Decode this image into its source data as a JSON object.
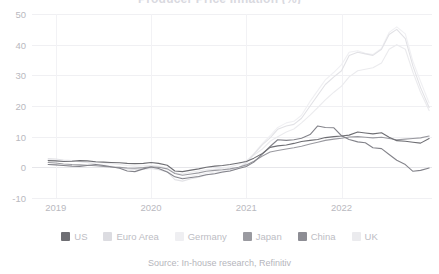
{
  "chart_data": {
    "type": "line",
    "title": "Producer Price Inflation (%)",
    "xlabel": "",
    "ylabel": "",
    "ylim": [
      -10,
      50
    ],
    "yticks": [
      50,
      40,
      30,
      20,
      10,
      0,
      -10
    ],
    "xticks": [
      "2019",
      "2020",
      "2021",
      "2022"
    ],
    "xtick_positions": [
      2019.0,
      2020.0,
      2021.0,
      2022.0
    ],
    "xlim": [
      2018.75,
      2022.95
    ],
    "grid": true,
    "legend_position": "bottom",
    "source": "Source: In-house research, Refinitiv",
    "x": [
      2018.92,
      2019.0,
      2019.08,
      2019.17,
      2019.25,
      2019.33,
      2019.42,
      2019.5,
      2019.58,
      2019.67,
      2019.75,
      2019.83,
      2019.92,
      2020.0,
      2020.08,
      2020.17,
      2020.25,
      2020.33,
      2020.42,
      2020.5,
      2020.58,
      2020.67,
      2020.75,
      2020.83,
      2020.92,
      2021.0,
      2021.08,
      2021.17,
      2021.25,
      2021.33,
      2021.42,
      2021.5,
      2021.58,
      2021.67,
      2021.75,
      2021.83,
      2021.92,
      2022.0,
      2022.08,
      2022.17,
      2022.25,
      2022.33,
      2022.42,
      2022.5,
      2022.58,
      2022.67,
      2022.75,
      2022.83,
      2022.92
    ],
    "series": [
      {
        "name": "US",
        "color": "#6e6e73",
        "values": [
          2.2,
          2.1,
          1.9,
          2.0,
          2.2,
          2.1,
          1.8,
          1.7,
          1.6,
          1.5,
          1.3,
          1.2,
          1.3,
          1.6,
          1.3,
          0.7,
          -1.2,
          -1.4,
          -0.9,
          -0.5,
          0.0,
          0.4,
          0.6,
          0.9,
          1.4,
          1.9,
          3.0,
          4.5,
          6.5,
          7.0,
          7.3,
          7.8,
          8.4,
          8.8,
          9.1,
          9.7,
          10.0,
          10.2,
          10.5,
          11.5,
          11.2,
          10.9,
          11.3,
          9.8,
          8.7,
          8.5,
          8.2,
          7.9,
          9.4
        ]
      },
      {
        "name": "Euro Area",
        "color": "#e2e2e6",
        "values": [
          2.9,
          2.7,
          2.4,
          2.2,
          2.0,
          1.6,
          1.0,
          0.6,
          0.2,
          -0.2,
          -0.5,
          -0.7,
          -0.6,
          -0.4,
          -0.8,
          -1.5,
          -4.0,
          -4.5,
          -3.7,
          -3.2,
          -2.5,
          -2.0,
          -1.7,
          -1.1,
          -0.3,
          1.4,
          4.3,
          7.4,
          9.6,
          12.4,
          13.5,
          14.0,
          16.0,
          20.0,
          23.5,
          27.0,
          29.5,
          31.5,
          36.5,
          37.5,
          37.0,
          36.5,
          38.5,
          43.3,
          45.0,
          42.0,
          33.0,
          26.0,
          19.5
        ]
      },
      {
        "name": "Germany",
        "color": "#f0f0f3",
        "values": [
          2.6,
          2.4,
          2.2,
          2.0,
          1.8,
          1.5,
          1.1,
          0.8,
          0.4,
          0.0,
          -0.3,
          -0.6,
          -0.5,
          -0.3,
          -0.6,
          -1.2,
          -3.0,
          -3.4,
          -2.8,
          -2.4,
          -1.9,
          -1.5,
          -1.2,
          -0.8,
          -0.1,
          1.9,
          4.5,
          7.8,
          10.3,
          13.0,
          14.5,
          15.0,
          17.0,
          21.5,
          25.0,
          28.5,
          31.0,
          33.5,
          37.5,
          38.0,
          37.2,
          36.8,
          38.8,
          44.0,
          45.8,
          43.5,
          34.5,
          28.0,
          21.0
        ]
      },
      {
        "name": "Japan",
        "color": "#9a9aa0",
        "values": [
          1.6,
          1.4,
          1.1,
          0.9,
          0.8,
          0.7,
          0.5,
          0.3,
          0.1,
          0.0,
          -0.2,
          -0.3,
          -0.1,
          0.2,
          0.0,
          -0.5,
          -2.0,
          -2.6,
          -2.2,
          -1.8,
          -1.3,
          -1.0,
          -0.8,
          -0.5,
          0.0,
          0.8,
          2.0,
          3.7,
          5.0,
          5.5,
          6.0,
          6.4,
          6.9,
          7.6,
          8.2,
          8.8,
          9.2,
          9.5,
          9.9,
          10.0,
          9.8,
          9.6,
          9.8,
          9.4,
          9.0,
          9.2,
          9.4,
          9.6,
          10.2
        ]
      },
      {
        "name": "China",
        "color": "#83838a",
        "values": [
          0.9,
          0.8,
          0.6,
          0.4,
          0.3,
          0.6,
          0.9,
          0.6,
          0.2,
          -0.3,
          -1.2,
          -1.4,
          -0.5,
          0.1,
          -0.4,
          -1.5,
          -3.1,
          -3.7,
          -3.3,
          -3.0,
          -2.4,
          -2.1,
          -1.5,
          -1.2,
          -0.4,
          0.3,
          1.7,
          4.4,
          6.8,
          9.0,
          8.8,
          9.0,
          9.5,
          10.7,
          13.5,
          13.0,
          12.9,
          10.3,
          9.1,
          8.3,
          8.0,
          6.4,
          6.1,
          4.2,
          2.3,
          0.9,
          -1.3,
          -1.0,
          -0.2
        ]
      },
      {
        "name": "UK",
        "color": "#ebebee",
        "values": [
          2.4,
          2.2,
          2.1,
          2.0,
          1.8,
          1.7,
          1.6,
          1.5,
          1.2,
          0.9,
          0.6,
          0.4,
          0.5,
          0.7,
          0.4,
          -0.2,
          -1.8,
          -2.2,
          -1.6,
          -1.2,
          -0.8,
          -0.6,
          -0.3,
          0.2,
          0.9,
          2.2,
          4.0,
          6.0,
          8.5,
          10.0,
          11.5,
          12.5,
          14.5,
          17.0,
          19.5,
          22.0,
          24.5,
          26.5,
          29.5,
          31.5,
          32.0,
          32.5,
          34.0,
          38.5,
          40.0,
          38.5,
          31.0,
          24.5,
          18.5
        ]
      }
    ]
  },
  "legend": {
    "items": [
      {
        "label": "US",
        "color": "#6e6e73"
      },
      {
        "label": "Euro Area",
        "color": "#dcdce1"
      },
      {
        "label": "Germany",
        "color": "#efeff2"
      },
      {
        "label": "Japan",
        "color": "#9a9aa0"
      },
      {
        "label": "China",
        "color": "#8d8d94"
      },
      {
        "label": "UK",
        "color": "#ebebee"
      }
    ]
  }
}
